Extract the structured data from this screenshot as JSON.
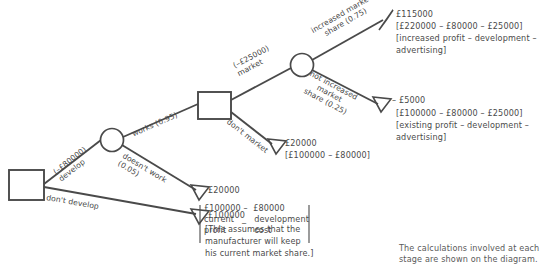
{
  "diagram": {
    "type": "decision-tree",
    "nodes": [
      {
        "id": "d1",
        "shape": "square",
        "role": "decision-node-develop"
      },
      {
        "id": "c1",
        "shape": "circle",
        "role": "chance-node-works"
      },
      {
        "id": "d2",
        "shape": "square",
        "role": "decision-node-market"
      },
      {
        "id": "c2",
        "shape": "circle",
        "role": "chance-node-market-share"
      }
    ],
    "branches": {
      "develop": "(–£80000)\ndevelop",
      "dont_develop": "don't develop",
      "works": "works (0.95)",
      "doesnt_work": "doesn't work\n(0.05)",
      "market": "(–£25000)\nmarket",
      "dont_market": "don't market",
      "increased_share": "increased market\nshare (0.75)",
      "not_increased_share": "not increased\nmarket\nshare (0.25)"
    },
    "outcomes": [
      {
        "id": "increased-share-outcome",
        "value": "£115000",
        "calculation": "[£220000 – £80000 – £25000]",
        "explanation_line1": "[increased profit – development –",
        "explanation_line2": "advertising]"
      },
      {
        "id": "not-increased-share-outcome",
        "value": "– £5000",
        "calculation": "[£100000 – £80000 – £25000]",
        "explanation_line1": "[existing profit – development –",
        "explanation_line2": "advertising]"
      },
      {
        "id": "dont-market-outcome",
        "value": "£20000",
        "calculation": "[£100000 – £80000]"
      },
      {
        "id": "doesnt-work-outcome",
        "value": "£20000",
        "calc_top": "£100000 –  £80000",
        "calc_left_1": "current",
        "calc_op": "_",
        "calc_right_1": "development",
        "calc_left_2": "profit",
        "calc_right_2": "cost"
      },
      {
        "id": "dont-develop-outcome",
        "value": "£100000",
        "note_line1": "[This assumes that the",
        "note_line2": "manufacturer will keep",
        "note_line3": "his current market share.]"
      }
    ],
    "caption": {
      "line1": "The calculations involved at each",
      "line2": "stage are shown on the diagram."
    },
    "colors": {
      "line": "#4a4a4a",
      "text": "#4a4a4a",
      "background": "#ffffff"
    }
  }
}
